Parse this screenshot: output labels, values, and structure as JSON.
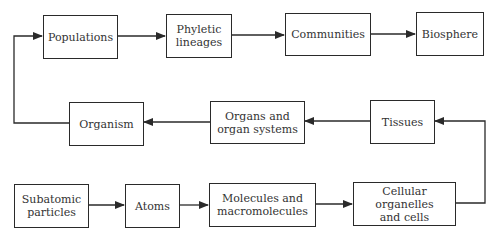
{
  "diagram": {
    "nodes": [
      {
        "id": "subatomic",
        "label": "Subatomic particles"
      },
      {
        "id": "atoms",
        "label": "Atoms"
      },
      {
        "id": "molecules",
        "label": "Molecules and macromolecules"
      },
      {
        "id": "organelles",
        "label": "Cellular organelles and cells"
      },
      {
        "id": "tissues",
        "label": "Tissues"
      },
      {
        "id": "organs",
        "label": "Organs and organ systems"
      },
      {
        "id": "organism",
        "label": "Organism"
      },
      {
        "id": "populations",
        "label": "Populations"
      },
      {
        "id": "phyletic",
        "label": "Phyletic lineages"
      },
      {
        "id": "communities",
        "label": "Communities"
      },
      {
        "id": "biosphere",
        "label": "Biosphere"
      }
    ],
    "edges": [
      [
        "subatomic",
        "atoms"
      ],
      [
        "atoms",
        "molecules"
      ],
      [
        "molecules",
        "organelles"
      ],
      [
        "organelles",
        "tissues"
      ],
      [
        "tissues",
        "organs"
      ],
      [
        "organs",
        "organism"
      ],
      [
        "organism",
        "populations"
      ],
      [
        "populations",
        "phyletic"
      ],
      [
        "phyletic",
        "communities"
      ],
      [
        "communities",
        "biosphere"
      ]
    ]
  },
  "labels": {
    "populations": "Populations",
    "phyletic_1": "Phyletic",
    "phyletic_2": "lineages",
    "communities": "Communities",
    "biosphere": "Biosphere",
    "organism": "Organism",
    "organs_1": "Organs and",
    "organs_2": "organ systems",
    "tissues": "Tissues",
    "subatomic_1": "Subatomic",
    "subatomic_2": "particles",
    "atoms": "Atoms",
    "molecules_1": "Molecules and",
    "molecules_2": "macromolecules",
    "organelles_1": "Cellular organelles",
    "organelles_2": "and cells"
  },
  "colors": {
    "line": "#2a2a2a",
    "text": "#333333",
    "background": "#ffffff"
  }
}
